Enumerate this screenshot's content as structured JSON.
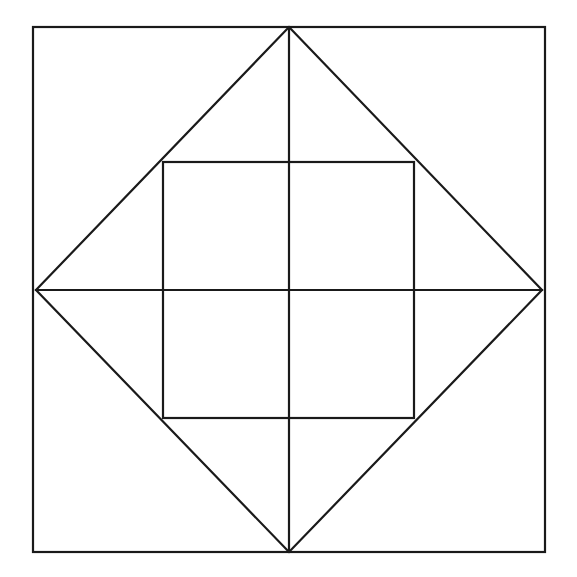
{
  "document": {
    "title": "Nested Squares Geometric Figure",
    "background_color": "#ffffff",
    "stroke_color": "#1a1a1a",
    "stroke_width": 2.2,
    "canvas": {
      "width": 577,
      "height": 577
    }
  },
  "figure": {
    "description": "A large axis-aligned outer square containing an inscribed rotated square (diamond) whose vertices touch the midpoints of the outer square's sides, plus a smaller axis-aligned square inside the diamond, and a vertical and horizontal line through the center spanning the diamond's diagonals.",
    "shapes": {
      "outer_square": {
        "name": "outer-square",
        "type": "rectangle",
        "x": 33,
        "y": 27,
        "width": 512,
        "height": 525,
        "corners": [
          [
            33,
            27
          ],
          [
            545,
            27
          ],
          [
            545,
            552
          ],
          [
            33,
            552
          ]
        ]
      },
      "diamond": {
        "name": "inscribed-diamond",
        "type": "polygon",
        "vertices": [
          [
            289,
            27
          ],
          [
            542,
            290
          ],
          [
            289,
            552
          ],
          [
            36,
            290
          ]
        ],
        "vertex_labels": [
          "top",
          "right",
          "bottom",
          "left"
        ],
        "points_attr": "289,27 542,290 289,552 36,290"
      },
      "inner_square": {
        "name": "inner-square",
        "type": "rectangle",
        "x": 163,
        "y": 162,
        "width": 251,
        "height": 256,
        "corners": [
          [
            163,
            162
          ],
          [
            414,
            162
          ],
          [
            414,
            418
          ],
          [
            163,
            418
          ]
        ]
      },
      "vertical_axis": {
        "name": "vertical-diagonal",
        "type": "line",
        "x1": 289,
        "y1": 27,
        "x2": 289,
        "y2": 552
      },
      "horizontal_axis": {
        "name": "horizontal-diagonal",
        "type": "line",
        "x1": 36,
        "y1": 290,
        "x2": 542,
        "y2": 290
      }
    },
    "center_point": {
      "x": 289,
      "y": 290
    }
  },
  "chart_data": {
    "type": "diagram",
    "xlabel": "",
    "ylabel": "",
    "grid": false,
    "legend": "none",
    "elements": [
      {
        "label": "Outer square",
        "points": [
          [
            33,
            27
          ],
          [
            545,
            27
          ],
          [
            545,
            552
          ],
          [
            33,
            552
          ]
        ]
      },
      {
        "label": "Inscribed diamond",
        "points": [
          [
            289,
            27
          ],
          [
            542,
            290
          ],
          [
            289,
            552
          ],
          [
            36,
            290
          ]
        ]
      },
      {
        "label": "Inner square",
        "points": [
          [
            163,
            162
          ],
          [
            414,
            162
          ],
          [
            414,
            418
          ],
          [
            163,
            418
          ]
        ]
      },
      {
        "label": "Vertical diagonal",
        "points": [
          [
            289,
            27
          ],
          [
            289,
            552
          ]
        ]
      },
      {
        "label": "Horizontal diagonal",
        "points": [
          [
            36,
            290
          ],
          [
            542,
            290
          ]
        ]
      }
    ]
  }
}
